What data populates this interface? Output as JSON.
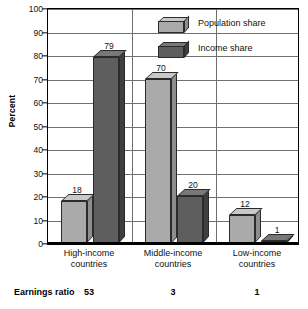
{
  "chart_data": {
    "type": "bar",
    "title": "",
    "subtitle": "",
    "xlabel": "",
    "ylabel": "Percent",
    "ylim": [
      0,
      100
    ],
    "yticks": [
      0,
      10,
      20,
      30,
      40,
      50,
      60,
      70,
      80,
      90,
      100
    ],
    "ytick_labels": [
      "0",
      "10",
      "20",
      "30",
      "40",
      "50",
      "60",
      "70",
      "80",
      "90",
      "100"
    ],
    "grid": "horizontal-and-vertical",
    "legend_position": "top-center-inside",
    "categories": [
      "High-income countries",
      "Middle-income countries",
      "Low-income countries"
    ],
    "category_lines": [
      [
        "High-income",
        "countries"
      ],
      [
        "Middle-income",
        "countries"
      ],
      [
        "Low-income",
        "countries"
      ]
    ],
    "series": [
      {
        "name": "Population share",
        "color": "#aaaaaa",
        "values": [
          18,
          70,
          12
        ],
        "value_labels": [
          "18",
          "70",
          "12"
        ]
      },
      {
        "name": "Income share",
        "color": "#5e5e5e",
        "values": [
          79,
          20,
          1
        ],
        "value_labels": [
          "79",
          "20",
          "1"
        ]
      }
    ],
    "annotations": {
      "row_label": "Earnings ratio",
      "row_values": [
        "53",
        "3",
        "1"
      ]
    }
  },
  "legend": {
    "items": [
      {
        "label": "Population share",
        "swatch": "light-cube-icon"
      },
      {
        "label": "Income share",
        "swatch": "dark-cube-icon"
      }
    ]
  },
  "footer": {
    "label": "Earnings ratio",
    "values": [
      "53",
      "3",
      "1"
    ]
  },
  "colors": {
    "population_share": "#aaaaaa",
    "income_share": "#5e5e5e",
    "grid": "#6f6f6f",
    "frame": "#000000"
  }
}
